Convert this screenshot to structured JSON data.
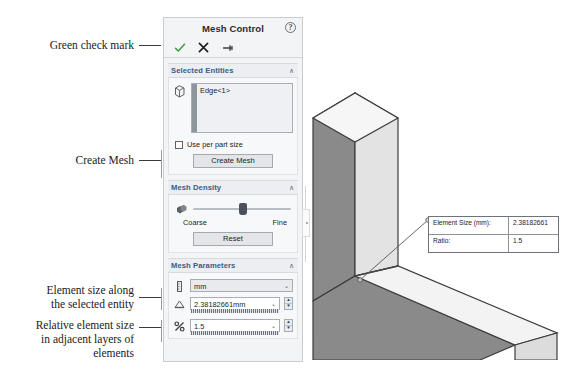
{
  "annotations": [
    {
      "text": "Green check mark",
      "name": "annotation-green-check-mark"
    },
    {
      "text": "Create Mesh",
      "name": "annotation-create-mesh"
    },
    {
      "text": "Element size along\nthe selected entity",
      "name": "annotation-element-size"
    },
    {
      "text": "Relative element size\nin adjacent layers of\nelements",
      "name": "annotation-relative-element-size"
    }
  ],
  "panel": {
    "title": "Mesh Control",
    "help_glyph": "?",
    "toolbar": {
      "accept_label": "✓",
      "cancel_label": "✕",
      "pin_label": "↦"
    },
    "sections": {
      "selected_entities": {
        "title": "Selected Entities",
        "chevron": "∧",
        "items": [
          "Edge<1>"
        ],
        "checkbox": {
          "label": "Use per part size",
          "checked": false
        },
        "button": "Create Mesh"
      },
      "mesh_density": {
        "title": "Mesh Density",
        "chevron": "∧",
        "coarse_label": "Coarse",
        "fine_label": "Fine",
        "slider_value": 47,
        "reset_button": "Reset"
      },
      "mesh_parameters": {
        "title": "Mesh Parameters",
        "chevron": "∧",
        "units_value": "mm",
        "element_size_value": "2.38182661mm",
        "ratio_value": "1.5",
        "dropdown_glyph": "⌄",
        "spin_up_glyph": "▲",
        "spin_down_glyph": "▼"
      }
    }
  },
  "callout": {
    "rows": [
      {
        "key": "Element Size (mm):",
        "value": "2.38182661"
      },
      {
        "key": "Ratio:",
        "value": "1.5"
      }
    ]
  },
  "colors": {
    "accent_check": "#3a9a3a",
    "section_header_text": "#3b5c86",
    "panel_background": "#f3f4f6",
    "model_light": "#f0f0f0",
    "model_mid": "#d0d0d0",
    "model_dark": "#848484"
  }
}
